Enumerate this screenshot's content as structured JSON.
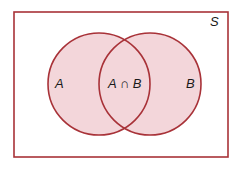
{
  "diagram": {
    "type": "venn",
    "universe": {
      "label": "S"
    },
    "sets": [
      {
        "id": "A",
        "label": "A"
      },
      {
        "id": "B",
        "label": "B"
      }
    ],
    "intersection": {
      "label": "A ∩ B"
    },
    "colors": {
      "outline": "#a83238",
      "fill": "#f3d6da",
      "background": "#ffffff",
      "text": "#1a1a1a"
    }
  }
}
